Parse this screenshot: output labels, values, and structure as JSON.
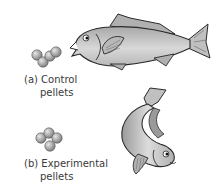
{
  "panels": [
    {
      "id": "a",
      "label_line1": "(a) Control",
      "label_line2": "pellets",
      "pellet_count": 4,
      "fish_pose": "horizontal, facing left, mouth open toward pellets"
    },
    {
      "id": "b",
      "label_line1": "(b) Experimental",
      "label_line2": "pellets",
      "pellet_count": 4,
      "fish_pose": "curved body, head down facing right"
    }
  ],
  "colors": {
    "fish_body": "#c8c8c8",
    "fish_shade": "#9a9a9a",
    "outline": "#2a2a2a",
    "pellet": "#9a9a9a"
  }
}
